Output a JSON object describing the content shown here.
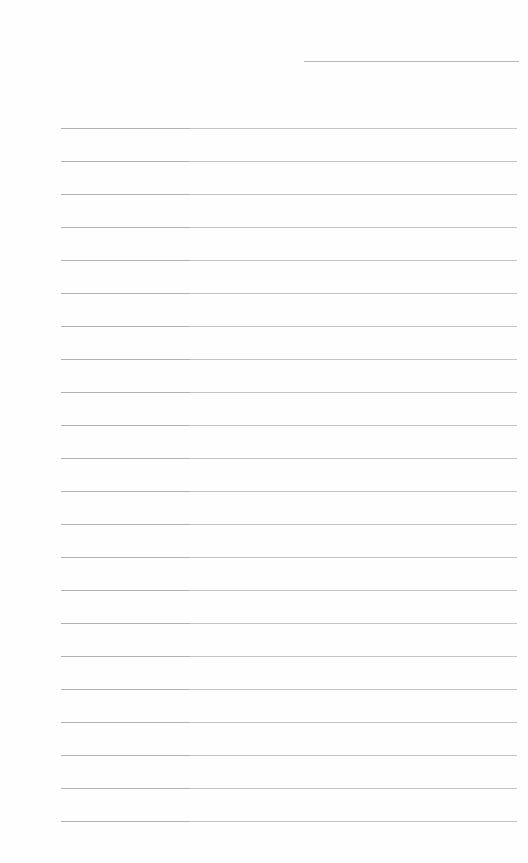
{
  "document": {
    "type": "lined-paper",
    "header_field": {
      "value": ""
    },
    "line_spacing_px": 33,
    "lines": [
      {
        "text": ""
      },
      {
        "text": ""
      },
      {
        "text": ""
      },
      {
        "text": ""
      },
      {
        "text": ""
      },
      {
        "text": ""
      },
      {
        "text": ""
      },
      {
        "text": ""
      },
      {
        "text": ""
      },
      {
        "text": ""
      },
      {
        "text": ""
      },
      {
        "text": ""
      },
      {
        "text": ""
      },
      {
        "text": ""
      },
      {
        "text": ""
      },
      {
        "text": ""
      },
      {
        "text": ""
      },
      {
        "text": ""
      },
      {
        "text": ""
      },
      {
        "text": ""
      },
      {
        "text": ""
      },
      {
        "text": ""
      }
    ]
  },
  "colors": {
    "paper": "#fefefe",
    "rule": "#c4c4c4",
    "rule_dark": "#b2b2b2"
  }
}
